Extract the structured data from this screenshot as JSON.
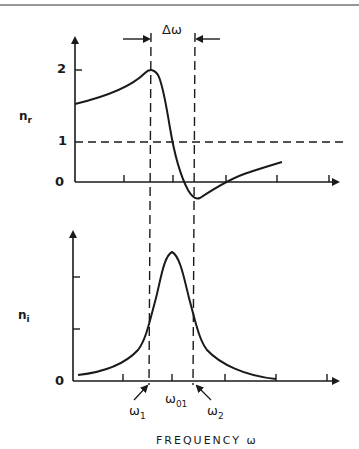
{
  "figure": {
    "delta_omega_label": "Δω",
    "upper_panel": {
      "y_label": "n",
      "y_label_sub": "r",
      "y_ticks": [
        "2",
        "1",
        "0"
      ],
      "reference_line_value": "1"
    },
    "lower_panel": {
      "y_label": "n",
      "y_label_sub": "i",
      "y_origin": "0"
    },
    "x_markers": {
      "omega1": "ω",
      "omega1_sub": "1",
      "omega01": "ω",
      "omega01_sub": "01",
      "omega2": "ω",
      "omega2_sub": "2"
    },
    "x_axis_label": "FREQUENCY ω"
  },
  "colors": {
    "ink": "#1a1a1a",
    "background": "#ffffff"
  }
}
